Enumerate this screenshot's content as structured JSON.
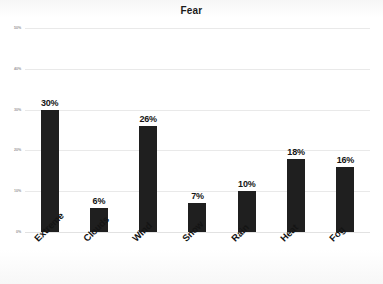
{
  "chart_data": {
    "type": "bar",
    "title": "Fear",
    "xlabel": "",
    "ylabel": "",
    "categories": [
      "Extreme",
      "Clouds",
      "Wind",
      "Snow",
      "Rain",
      "Heat",
      "Fog"
    ],
    "values": [
      30,
      6,
      26,
      7,
      10,
      18,
      16
    ],
    "value_labels": [
      "30%",
      "6%",
      "26%",
      "7%",
      "10%",
      "18%",
      "16%"
    ],
    "ylim": [
      0,
      50
    ],
    "ytick_values": [
      50,
      40,
      30,
      20,
      10,
      0
    ],
    "ytick_labels": [
      "50%",
      "40%",
      "30%",
      "20%",
      "10%",
      "0%"
    ],
    "grid": true,
    "legend": "none",
    "bar_color": "#1f1f1f",
    "gridline_color": "#e9e9e9",
    "title_color": "#1b1b1b",
    "label_color": "#141414",
    "background_color": "#fdfdfd"
  }
}
